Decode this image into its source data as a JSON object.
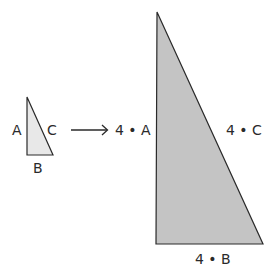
{
  "diagram": {
    "colors": {
      "small_fill": "#e8e8e8",
      "large_fill": "#c4c4c4",
      "stroke": "#2a2a2a"
    },
    "small_triangle": {
      "label_a": "A",
      "label_b": "B",
      "label_c": "C"
    },
    "arrow": {
      "direction": "right"
    },
    "large_triangle": {
      "label_a": "4 • A",
      "label_b": "4 • B",
      "label_c": "4 • C"
    }
  }
}
